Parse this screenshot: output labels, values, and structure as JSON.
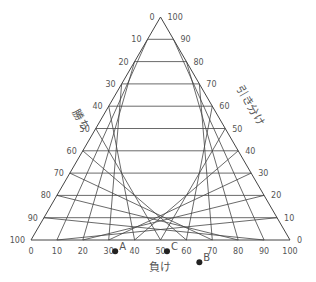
{
  "diagram": {
    "type": "ternary",
    "axes": {
      "left": {
        "label": "勝ち",
        "ticks": [
          "0",
          "10",
          "20",
          "30",
          "40",
          "50",
          "60",
          "70",
          "80",
          "90",
          "100"
        ]
      },
      "right": {
        "label": "引き分け",
        "ticks": [
          "100",
          "90",
          "80",
          "70",
          "60",
          "50",
          "40",
          "30",
          "20",
          "10",
          "0"
        ]
      },
      "bottom": {
        "label": "負け",
        "ticks": [
          "0",
          "10",
          "20",
          "30",
          "40",
          "50",
          "60",
          "70",
          "80",
          "90",
          "100"
        ]
      }
    },
    "points": [
      {
        "label": "A",
        "win": 70,
        "lose": 35
      },
      {
        "label": "B",
        "win": 40,
        "lose": 70
      },
      {
        "label": "C",
        "win": 50,
        "lose": 55
      }
    ],
    "colors": {
      "line": "#444444",
      "text": "#555555",
      "point": "#222222"
    }
  }
}
